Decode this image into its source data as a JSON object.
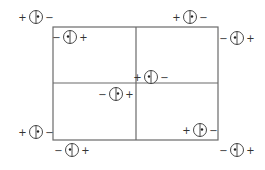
{
  "diagram": {
    "frame": {
      "left": 53,
      "top": 27,
      "right": 218,
      "bottom": 140,
      "mid_x": 136,
      "mid_y": 83,
      "stroke": "#6a6a6a"
    },
    "symbols": [
      {
        "id": "s1",
        "cx": 36,
        "cy": 17,
        "left_sign": "+",
        "right_sign": "−",
        "dot": "right"
      },
      {
        "id": "s2",
        "cx": 70,
        "cy": 37,
        "left_sign": "−",
        "right_sign": "+",
        "dot": "left"
      },
      {
        "id": "s3",
        "cx": 190,
        "cy": 17,
        "left_sign": "+",
        "right_sign": "−",
        "dot": "right"
      },
      {
        "id": "s4",
        "cx": 237,
        "cy": 38,
        "left_sign": "−",
        "right_sign": "+",
        "dot": "left"
      },
      {
        "id": "s5",
        "cx": 151,
        "cy": 77,
        "left_sign": "+",
        "right_sign": "−",
        "dot": "left"
      },
      {
        "id": "s6",
        "cx": 116,
        "cy": 94,
        "left_sign": "−",
        "right_sign": "+",
        "dot": "right"
      },
      {
        "id": "s7",
        "cx": 36,
        "cy": 132,
        "left_sign": "+",
        "right_sign": "−",
        "dot": "right"
      },
      {
        "id": "s8",
        "cx": 72,
        "cy": 150,
        "left_sign": "−",
        "right_sign": "+",
        "dot": "left"
      },
      {
        "id": "s9",
        "cx": 200,
        "cy": 130,
        "left_sign": "+",
        "right_sign": "−",
        "dot": "right"
      },
      {
        "id": "s10",
        "cx": 237,
        "cy": 150,
        "left_sign": "−",
        "right_sign": "+",
        "dot": "left"
      }
    ]
  }
}
